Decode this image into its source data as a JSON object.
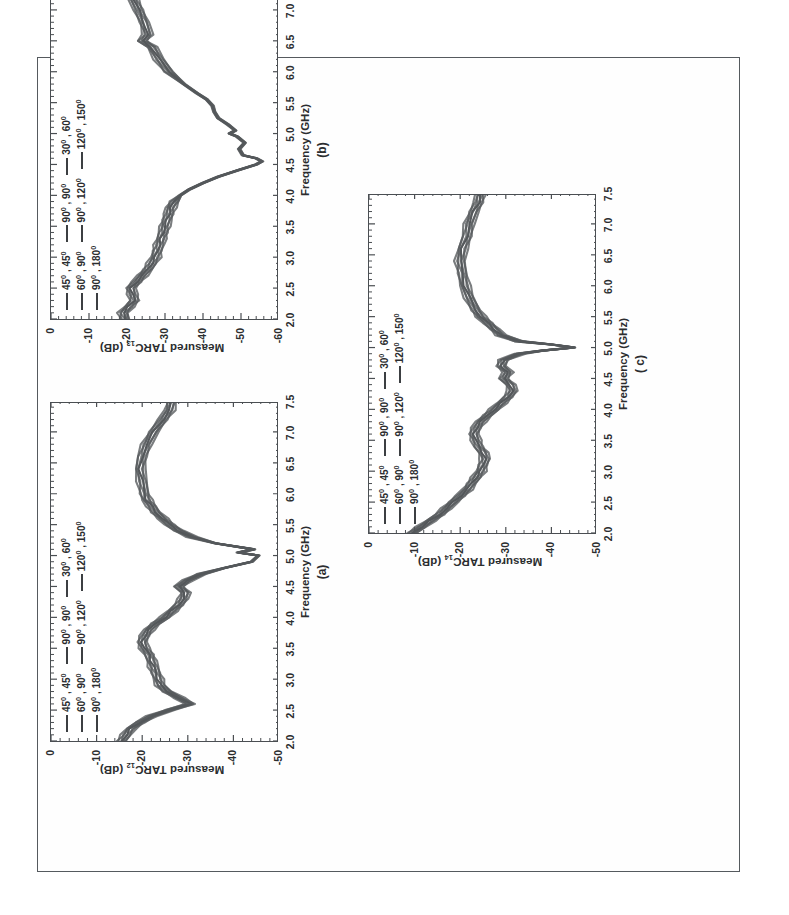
{
  "document": {
    "kind": "scanned-figure-page",
    "orientation_note": "figure rotated 90 degrees on page",
    "border_color": "#555a5e",
    "background": "#ffffff"
  },
  "figure": {
    "trace_color": "#55585b",
    "axis_color": "#4a4e52",
    "legend": {
      "rows": [
        [
          {
            "line": "legend-line",
            "label": "45⁰ , 45⁰"
          },
          {
            "line": "legend-line",
            "label": "90⁰ , 90⁰"
          },
          {
            "line": "legend-line",
            "label": "30⁰ , 60⁰"
          }
        ],
        [
          {
            "line": "legend-line",
            "label": "60⁰ , 90⁰"
          },
          {
            "line": "legend-line",
            "label": "90⁰ , 120⁰"
          },
          {
            "line": "legend-line",
            "label": "120⁰ , 150⁰"
          }
        ],
        [
          {
            "line": "legend-line",
            "label": "90⁰ , 180⁰"
          }
        ]
      ]
    },
    "panels": [
      {
        "id": "a",
        "caption": "(a)",
        "ylabel_plain": "Measured TARC12 (dB)",
        "ylabel_prefix": "Measured TARC",
        "ylabel_sub": "12",
        "ylabel_suffix": " (dB)",
        "xlabel": "Frequency (GHz)"
      },
      {
        "id": "b",
        "caption": "(b)",
        "ylabel_plain": "Measured TARC13 (dB)",
        "ylabel_prefix": "Measured TARC",
        "ylabel_sub": "13",
        "ylabel_suffix": " (dB)",
        "xlabel": "Frequency (GHz)"
      },
      {
        "id": "c",
        "caption": "( c)",
        "ylabel_plain": "Measured TARC14 (dB)",
        "ylabel_prefix": "Measured TARC",
        "ylabel_sub": "14",
        "ylabel_suffix": " (dB)",
        "xlabel": "Frequency (GHz)"
      }
    ]
  },
  "chart_data": [
    {
      "panel": "a",
      "type": "line",
      "title": "(a)",
      "xlabel": "Frequency (GHz)",
      "ylabel": "Measured TARC12 (dB)",
      "xlim": [
        2.0,
        7.5
      ],
      "ylim": [
        -50,
        0
      ],
      "xticks": [
        "2.0",
        "2.5",
        "3.0",
        "3.5",
        "4.0",
        "4.5",
        "5.0",
        "5.5",
        "6.0",
        "6.5",
        "7.0",
        "7.5"
      ],
      "yticks": [
        "0",
        "-10",
        "-20",
        "-30",
        "-40",
        "-50"
      ],
      "grid": false,
      "legend_position": "upper-left",
      "series": [
        {
          "name": "envelope of 45⁰,45⁰ / 60⁰,90⁰ / 90⁰,180⁰ / 90⁰,90⁰ / 90⁰,120⁰ / 30⁰,60⁰ / 120⁰,150⁰",
          "x": [
            2.0,
            2.1,
            2.2,
            2.3,
            2.4,
            2.5,
            2.6,
            2.7,
            2.8,
            2.9,
            3.0,
            3.1,
            3.2,
            3.3,
            3.4,
            3.5,
            3.6,
            3.7,
            3.8,
            3.9,
            4.0,
            4.1,
            4.2,
            4.3,
            4.4,
            4.5,
            4.6,
            4.7,
            4.8,
            4.9,
            5.0,
            5.05,
            5.1,
            5.2,
            5.3,
            5.4,
            5.5,
            5.6,
            5.7,
            5.8,
            5.9,
            6.0,
            6.2,
            6.4,
            6.6,
            6.8,
            7.0,
            7.2,
            7.35,
            7.5
          ],
          "y": [
            -15.5,
            -16.5,
            -17.5,
            -19.5,
            -22.0,
            -26.0,
            -30.5,
            -28.0,
            -25.5,
            -24.0,
            -23.5,
            -23.0,
            -22.5,
            -22.0,
            -21.5,
            -20.5,
            -20.0,
            -20.5,
            -21.5,
            -23.0,
            -25.0,
            -26.5,
            -28.0,
            -29.0,
            -29.5,
            -28.0,
            -30.0,
            -33.0,
            -38.0,
            -44.0,
            -45.5,
            -41.0,
            -44.5,
            -36.0,
            -31.0,
            -28.0,
            -26.0,
            -24.5,
            -23.0,
            -22.0,
            -21.0,
            -20.5,
            -20.0,
            -19.5,
            -20.0,
            -21.0,
            -22.5,
            -24.5,
            -26.0,
            -26.5
          ]
        }
      ]
    },
    {
      "panel": "b",
      "type": "line",
      "title": "(b)",
      "xlabel": "Frequency (GHz)",
      "ylabel": "Measured TARC13 (dB)",
      "xlim": [
        2.0,
        7.5
      ],
      "ylim": [
        -60,
        0
      ],
      "xticks": [
        "2.0",
        "2.5",
        "3.0",
        "3.5",
        "4.0",
        "4.5",
        "5.0",
        "5.5",
        "6.0",
        "6.5",
        "7.0",
        "7.5"
      ],
      "yticks": [
        "0",
        "-10",
        "-20",
        "-30",
        "-40",
        "-50",
        "-60"
      ],
      "grid": false,
      "legend_position": "upper-left",
      "series": [
        {
          "name": "envelope of 45⁰,45⁰ / 60⁰,90⁰ / 90⁰,180⁰ / 90⁰,90⁰ / 90⁰,120⁰ / 30⁰,60⁰ / 120⁰,150⁰",
          "x": [
            2.0,
            2.1,
            2.2,
            2.3,
            2.4,
            2.5,
            2.6,
            2.7,
            2.8,
            2.9,
            3.0,
            3.1,
            3.2,
            3.3,
            3.4,
            3.5,
            3.6,
            3.7,
            3.8,
            3.9,
            4.0,
            4.1,
            4.2,
            4.3,
            4.4,
            4.5,
            4.55,
            4.6,
            4.65,
            4.75,
            4.85,
            4.95,
            5.0,
            5.05,
            5.15,
            5.25,
            5.35,
            5.45,
            5.55,
            5.65,
            5.8,
            6.0,
            6.2,
            6.4,
            6.5,
            6.6,
            6.8,
            7.0,
            7.2,
            7.35,
            7.5
          ],
          "y": [
            -19.5,
            -19.0,
            -20.5,
            -22.0,
            -21.5,
            -21.0,
            -22.5,
            -24.0,
            -25.5,
            -26.5,
            -27.5,
            -28.0,
            -28.5,
            -29.0,
            -29.5,
            -30.0,
            -30.5,
            -31.0,
            -31.5,
            -32.5,
            -34.0,
            -36.5,
            -40.0,
            -44.0,
            -49.0,
            -54.0,
            -55.5,
            -54.0,
            -50.5,
            -49.5,
            -51.0,
            -49.0,
            -47.0,
            -48.5,
            -46.5,
            -44.0,
            -43.0,
            -42.5,
            -41.0,
            -38.5,
            -35.0,
            -31.0,
            -28.5,
            -26.5,
            -24.0,
            -25.5,
            -24.5,
            -23.0,
            -21.5,
            -20.0,
            -19.5
          ]
        }
      ]
    },
    {
      "panel": "c",
      "type": "line",
      "title": "( c)",
      "xlabel": "Frequency (GHz)",
      "ylabel": "Measured TARC14 (dB)",
      "xlim": [
        2.0,
        7.5
      ],
      "ylim": [
        -50,
        0
      ],
      "xticks": [
        "2.0",
        "2.5",
        "3.0",
        "3.5",
        "4.0",
        "4.5",
        "5.0",
        "5.5",
        "6.0",
        "6.5",
        "7.0",
        "7.5"
      ],
      "yticks": [
        "0",
        "-10",
        "-20",
        "-30",
        "-40",
        "-50"
      ],
      "grid": false,
      "legend_position": "upper-left",
      "series": [
        {
          "name": "envelope of 45⁰,45⁰ / 60⁰,90⁰ / 90⁰,180⁰ / 90⁰,90⁰ / 90⁰,120⁰ / 30⁰,60⁰ / 120⁰,150⁰",
          "x": [
            2.0,
            2.1,
            2.2,
            2.3,
            2.4,
            2.5,
            2.6,
            2.7,
            2.8,
            2.9,
            3.0,
            3.1,
            3.2,
            3.3,
            3.4,
            3.5,
            3.6,
            3.7,
            3.8,
            3.9,
            4.0,
            4.1,
            4.2,
            4.3,
            4.4,
            4.5,
            4.6,
            4.7,
            4.8,
            4.9,
            4.95,
            5.0,
            5.05,
            5.1,
            5.2,
            5.3,
            5.4,
            5.5,
            5.6,
            5.8,
            6.0,
            6.2,
            6.4,
            6.6,
            6.8,
            7.0,
            7.2,
            7.35,
            7.5
          ],
          "y": [
            -9.5,
            -11.5,
            -13.5,
            -15.5,
            -17.0,
            -18.5,
            -20.0,
            -21.5,
            -22.5,
            -23.5,
            -24.5,
            -25.0,
            -25.5,
            -25.0,
            -24.0,
            -23.5,
            -23.0,
            -23.5,
            -24.5,
            -26.0,
            -27.5,
            -29.0,
            -30.5,
            -31.5,
            -31.0,
            -29.5,
            -30.5,
            -29.0,
            -29.5,
            -33.0,
            -38.0,
            -45.0,
            -40.0,
            -33.0,
            -29.0,
            -27.5,
            -26.0,
            -24.5,
            -23.5,
            -22.0,
            -21.0,
            -20.5,
            -20.0,
            -20.5,
            -21.5,
            -22.0,
            -23.0,
            -24.0,
            -24.5
          ]
        }
      ]
    }
  ]
}
